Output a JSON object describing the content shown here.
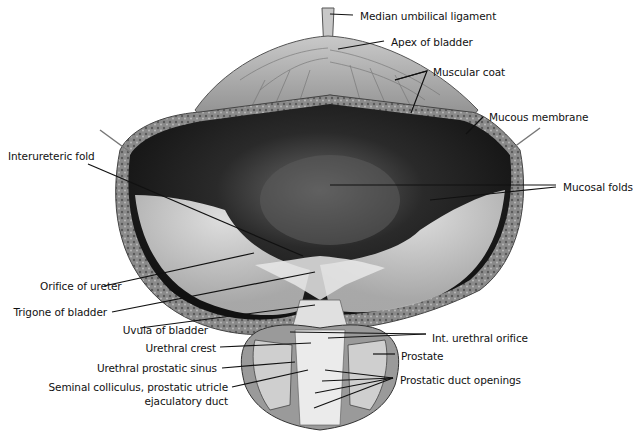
{
  "figure": {
    "labels_right": [
      {
        "id": "median-umbilical-ligament",
        "text": "Median umbilical ligament"
      },
      {
        "id": "apex-of-bladder",
        "text": "Apex of bladder"
      },
      {
        "id": "muscular-coat",
        "text": "Muscular coat"
      },
      {
        "id": "mucous-membrane",
        "text": "Mucous membrane"
      },
      {
        "id": "mucosal-folds",
        "text": "Mucosal folds"
      },
      {
        "id": "int-urethral-orifice",
        "text": "Int. urethral orifice"
      },
      {
        "id": "prostate",
        "text": "Prostate"
      },
      {
        "id": "prostatic-duct-openings",
        "text": "Prostatic duct openings"
      }
    ],
    "labels_left": [
      {
        "id": "interureteric-fold",
        "text": "Interureteric fold"
      },
      {
        "id": "orifice-of-ureter",
        "text": "Orifice of ureter"
      },
      {
        "id": "trigone-of-bladder",
        "text": "Trigone of bladder"
      },
      {
        "id": "uvula-of-bladder",
        "text": "Uvula of bladder"
      },
      {
        "id": "urethral-crest",
        "text": "Urethral crest"
      },
      {
        "id": "urethral-prostatic-sinus",
        "text": "Urethral prostatic sinus"
      },
      {
        "id": "seminal-colliculus",
        "text": "Seminal colliculus, prostatic utricle"
      },
      {
        "id": "ejaculatory-duct",
        "text": "ejaculatory duct"
      }
    ]
  }
}
